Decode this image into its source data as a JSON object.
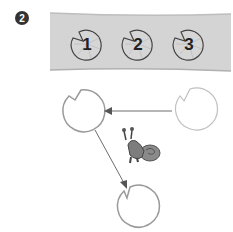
{
  "step_badge": {
    "label": "2",
    "color": "#333333"
  },
  "pond": {
    "fill": "#d4d4d4",
    "edge": "#b5b5b5"
  },
  "lily_pads_top": [
    {
      "label": "1"
    },
    {
      "label": "2"
    },
    {
      "label": "3"
    }
  ],
  "diagram": {
    "pads": [
      {
        "name": "left-pad"
      },
      {
        "name": "right-pad"
      },
      {
        "name": "bottom-pad"
      }
    ],
    "arrows": [
      {
        "from": "right-pad",
        "to": "left-pad"
      },
      {
        "from": "left-pad",
        "to": "bottom-pad"
      }
    ],
    "character": "snail"
  },
  "colors": {
    "pad_stroke": "#9a9a9a",
    "arrow": "#6e6e6e",
    "snail": "#7d7d7d"
  }
}
